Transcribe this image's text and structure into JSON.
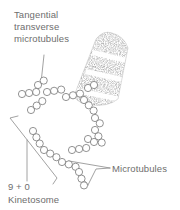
{
  "figure": {
    "background_color": "#ffffff",
    "ink_color": "#6e6e6e",
    "outline_color": "#6f6f6f",
    "stipple_color": "#4a4a4a"
  },
  "labels": {
    "tangential": {
      "name": "tangential-transverse-microtubules-label",
      "lines": [
        "Tangential",
        "transverse",
        "microtubules"
      ],
      "x": 14,
      "y": 18,
      "line_height": 12
    },
    "microtubules": {
      "name": "microtubules-label",
      "text": "Microtubules",
      "x": 112,
      "y": 172
    },
    "nine_plus_zero": {
      "name": "nine-plus-zero-label",
      "text": "9 + 0",
      "x": 8,
      "y": 190
    },
    "kinetosome": {
      "name": "kinetosome-label",
      "text": "Kinetosome",
      "x": 8,
      "y": 203
    }
  },
  "leaders": {
    "tangential_leader": "M44,55 L41,83",
    "microtubules_leader": "M110,168 L70,162 L88,184 L95,169 Z",
    "bracket_main": "M10,117 L58,177",
    "bracket_hook_top": "M10,117 L18,116",
    "bracket_hook_bottom": "M58,177 L54,183",
    "bracket_tick": "M27,139 L27,180"
  },
  "axostyle": {
    "name": "axostyle-cone",
    "description": "stippled tapered cone with light diagonal bands",
    "outline": "M112,33 Q103,30 96,39 L74,96 Q78,104 92,105 Q108,107 118,99 L128,48 Q124,36 112,33 Z",
    "bands": [
      "M99,52 L127,59",
      "M91,71 L124,78",
      "M82,90 L119,97"
    ]
  },
  "microtubule_groups": [
    {
      "name": "group-upper-left-a",
      "x": 38,
      "y": 85,
      "count": 2,
      "angle": -38
    },
    {
      "name": "group-upper-left-b",
      "x": 22,
      "y": 94,
      "count": 3,
      "angle": -8
    },
    {
      "name": "group-upper-mid",
      "x": 47,
      "y": 92,
      "count": 3,
      "angle": -10
    },
    {
      "name": "group-mid-left",
      "x": 31,
      "y": 106,
      "count": 3,
      "angle": -38
    },
    {
      "name": "group-cone-base-a",
      "x": 66,
      "y": 95,
      "count": 3,
      "angle": -14
    },
    {
      "name": "group-cone-base-b",
      "x": 86,
      "y": 100,
      "count": 3,
      "angle": 32
    },
    {
      "name": "group-cone-base-c",
      "x": 92,
      "y": 113,
      "count": 2,
      "angle": 48
    },
    {
      "name": "group-lower-right-a",
      "x": 96,
      "y": 129,
      "count": 3,
      "angle": 62
    },
    {
      "name": "group-left-chain-a",
      "x": 30,
      "y": 128,
      "count": 3,
      "angle": 62
    },
    {
      "name": "group-left-chain-b",
      "x": 40,
      "y": 146,
      "count": 3,
      "angle": 30
    },
    {
      "name": "group-mid-chain",
      "x": 50,
      "y": 157,
      "count": 3,
      "angle": 20
    },
    {
      "name": "group-lower-mid",
      "x": 62,
      "y": 166,
      "count": 3,
      "angle": 10
    },
    {
      "name": "group-lower-right-b",
      "x": 80,
      "y": 150,
      "count": 3,
      "angle": 0
    },
    {
      "name": "group-v-chain",
      "x": 78,
      "y": 175,
      "count": 3,
      "angle": 70
    },
    {
      "name": "group-far-right",
      "x": 90,
      "y": 141,
      "count": 2,
      "angle": 40
    }
  ],
  "tubule_radius": 3.6,
  "tubule_spacing": 7.2
}
